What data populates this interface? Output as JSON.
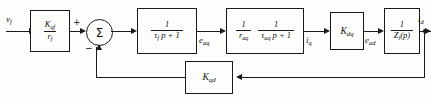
{
  "diagram": {
    "type": "block-diagram",
    "signals": {
      "input": "vƒ",
      "after_sum_block": "eₐq",
      "after_impedance_block": "i q",
      "after_gain_kdq": "eₐd",
      "output": "i d"
    },
    "labels": {
      "input": "v",
      "input_sub": "f",
      "sig_eaq": "e",
      "sig_eaq_sub": "aq",
      "sig_iq": "i",
      "sig_iq_sub": "q",
      "sig_ead": "e",
      "sig_ead_sub": "ad",
      "output": "i",
      "output_sub": "d",
      "plus_sign": "+",
      "minus_sign": "−",
      "sum_symbol": "Σ"
    },
    "blocks": [
      {
        "id": "gain-kqf",
        "name": "forward-gain-block",
        "kind": "fraction",
        "numerator": "K",
        "numerator_sub": "qf",
        "denominator": "r",
        "denominator_sub": "f"
      },
      {
        "id": "lag-tf",
        "name": "first-order-lag-block",
        "kind": "fraction",
        "numerator": "1",
        "denominator": "τ",
        "denominator_sub": "f",
        "denominator_tail": " p + 1"
      },
      {
        "id": "armature-block",
        "name": "armature-transfer-block",
        "kind": "double-fraction",
        "left_numerator": "1",
        "left_denominator": "r",
        "left_denominator_sub": "aq",
        "right_numerator": "1",
        "right_denominator": "τ",
        "right_denominator_sub": "aq",
        "right_denominator_tail": " p + 1"
      },
      {
        "id": "gain-kdq",
        "name": "cross-coupling-gain-block",
        "kind": "plain",
        "text": "K",
        "text_sub": "dq"
      },
      {
        "id": "impedance-block",
        "name": "load-impedance-block",
        "kind": "fraction",
        "numerator": "1",
        "denominator": "Z",
        "denominator_sub": "i",
        "denominator_tail": "(p)"
      },
      {
        "id": "gain-kqd",
        "name": "feedback-gain-block",
        "kind": "plain",
        "text": "K",
        "text_sub": "qd"
      }
    ],
    "colors": {
      "stroke": "#1a1a1a",
      "background": "#fdfdfb"
    }
  }
}
